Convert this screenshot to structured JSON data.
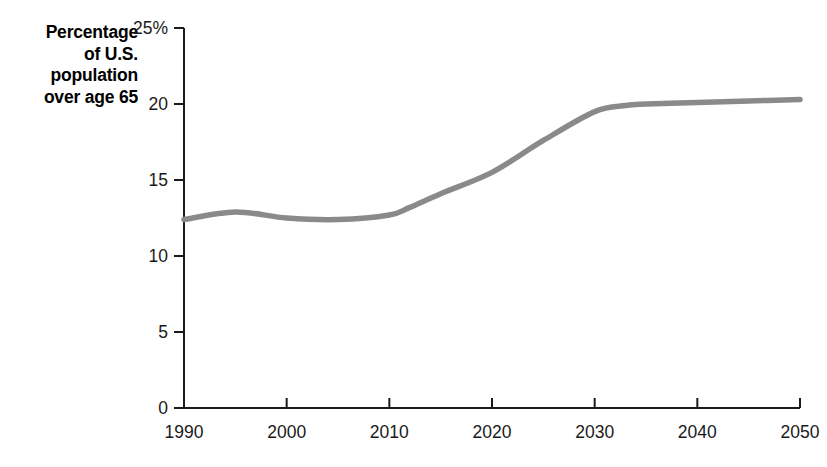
{
  "figure": {
    "background_color": "#ffffff",
    "axis_color": "#1a1a1a",
    "line_color": "#8a8a8a",
    "text_color": "#000000",
    "axis_title": "Percentage\nof U.S.\npopulation\nover age 65"
  },
  "chart_data": {
    "type": "line",
    "title": "",
    "subtitle": "",
    "xlabel": "",
    "ylabel": "Percentage of U.S. population over age 65",
    "xlim": [
      1990,
      2050
    ],
    "ylim": [
      0,
      25
    ],
    "grid": false,
    "legend": null,
    "legend_position": "none",
    "x_tick_labels": [
      "1990",
      "2000",
      "2010",
      "2020",
      "2030",
      "2040",
      "2050"
    ],
    "x_ticks": [
      1990,
      2000,
      2010,
      2020,
      2030,
      2040,
      2050
    ],
    "y_tick_labels": [
      "0",
      "5",
      "10",
      "15",
      "20",
      "25%"
    ],
    "y_ticks": [
      0,
      5,
      10,
      15,
      20,
      25
    ],
    "series": [
      {
        "name": "Percentage of U.S. population over age 65",
        "color": "#8a8a8a",
        "line_width": 5.5,
        "x": [
          1990,
          1995,
          2000,
          2005,
          2010,
          2012,
          2015,
          2020,
          2025,
          2030,
          2033,
          2035,
          2040,
          2045,
          2050
        ],
        "values": [
          12.4,
          12.9,
          12.5,
          12.4,
          12.7,
          13.2,
          14.1,
          15.5,
          17.6,
          19.5,
          19.9,
          20.0,
          20.1,
          20.2,
          20.3
        ]
      }
    ]
  }
}
